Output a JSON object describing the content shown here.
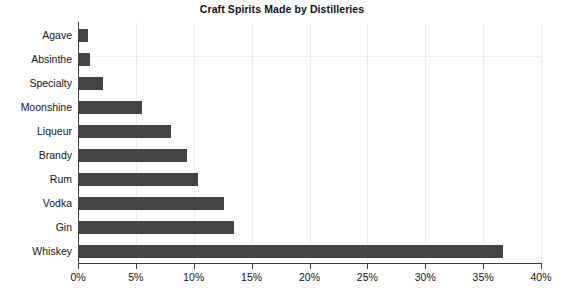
{
  "chart_data": {
    "type": "bar",
    "orientation": "horizontal",
    "title": "Craft Spirits Made by Distilleries",
    "xlabel": "",
    "ylabel": "",
    "categories": [
      "Agave",
      "Absinthe",
      "Specialty",
      "Moonshine",
      "Liqueur",
      "Brandy",
      "Rum",
      "Vodka",
      "Gin",
      "Whiskey"
    ],
    "values": [
      0.9,
      1.0,
      2.2,
      5.5,
      8.0,
      9.4,
      10.4,
      12.6,
      13.5,
      36.7
    ],
    "value_unit": "%",
    "xlim": [
      0,
      40
    ],
    "xticks": [
      0,
      5,
      10,
      15,
      20,
      25,
      30,
      35,
      40
    ],
    "xtick_labels": [
      "0%",
      "5%",
      "10%",
      "15%",
      "20%",
      "25%",
      "30%",
      "35%",
      "40%"
    ],
    "grid": true,
    "legend": false,
    "bar_color": "#434343",
    "grid_color": "#ececec",
    "axis_color": "#3a3a3a",
    "background_color": "#ffffff"
  }
}
